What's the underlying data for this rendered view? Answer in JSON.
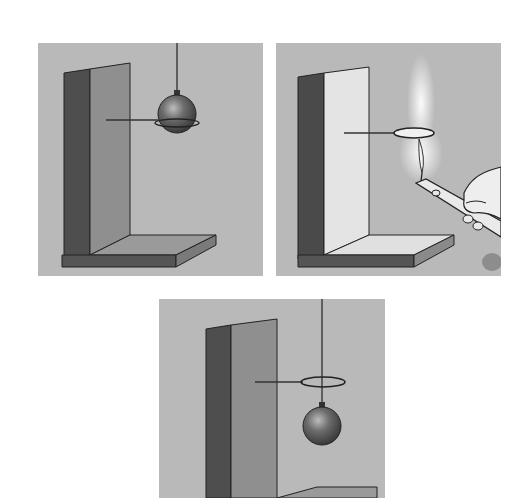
{
  "figure": {
    "colors": {
      "background": "#ffffff",
      "panel_bg": "#b9b9b9",
      "stand_dark": "#4a4a4a",
      "stand_face": "#8e8e8e",
      "stand_face_light": "#e6e6e6",
      "ball": "#6e6e6e",
      "line": "#222222"
    },
    "panels": [
      {
        "id": "p1",
        "label": "",
        "state": "cold ball resting on ring"
      },
      {
        "id": "p2",
        "label": "",
        "state": "ring heated with candle flame"
      },
      {
        "id": "p3",
        "label": "",
        "state": "ball passes through expanded ring"
      }
    ]
  }
}
